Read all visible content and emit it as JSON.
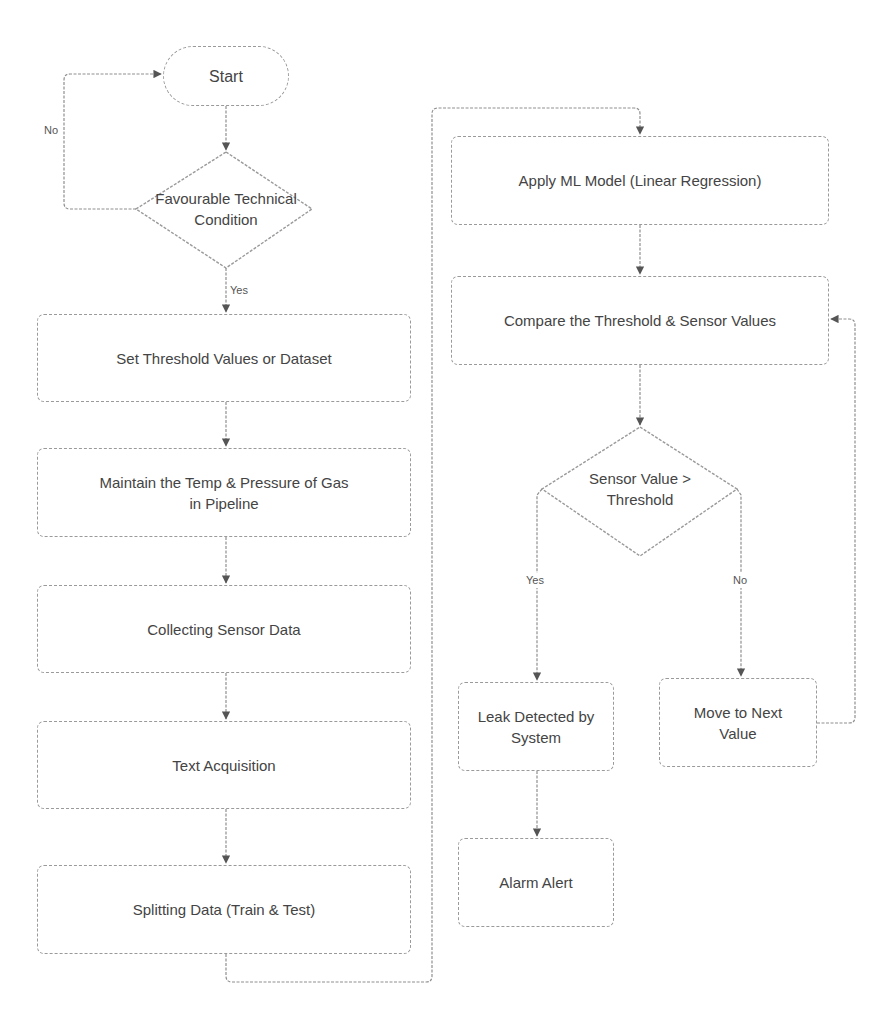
{
  "diagram": {
    "type": "flowchart",
    "nodes": {
      "start": "Start",
      "favourable": "Favourable Technical Condition",
      "set_threshold": "Set Threshold Values or Dataset",
      "maintain": "Maintain the Temp & Pressure of Gas in Pipeline",
      "collecting": "Collecting Sensor Data",
      "text_acquisition": "Text Acquisition",
      "splitting": "Splitting Data (Train & Test)",
      "apply_ml": "Apply ML Model (Linear Regression)",
      "compare": "Compare the Threshold & Sensor Values",
      "sensor_check": "Sensor Value > Threshold",
      "leak": "Leak Detected by System",
      "move_next": "Move to Next Value",
      "alarm": "Alarm Alert"
    },
    "edge_labels": {
      "favourable_no": "No",
      "favourable_yes": "Yes",
      "sensor_yes": "Yes",
      "sensor_no": "No"
    },
    "edges": [
      {
        "from": "start",
        "to": "favourable"
      },
      {
        "from": "favourable",
        "to": "start",
        "label": "No"
      },
      {
        "from": "favourable",
        "to": "set_threshold",
        "label": "Yes"
      },
      {
        "from": "set_threshold",
        "to": "maintain"
      },
      {
        "from": "maintain",
        "to": "collecting"
      },
      {
        "from": "collecting",
        "to": "text_acquisition"
      },
      {
        "from": "text_acquisition",
        "to": "splitting"
      },
      {
        "from": "splitting",
        "to": "apply_ml"
      },
      {
        "from": "apply_ml",
        "to": "compare"
      },
      {
        "from": "compare",
        "to": "sensor_check"
      },
      {
        "from": "sensor_check",
        "to": "leak",
        "label": "Yes"
      },
      {
        "from": "sensor_check",
        "to": "move_next",
        "label": "No"
      },
      {
        "from": "leak",
        "to": "alarm"
      },
      {
        "from": "move_next",
        "to": "compare"
      }
    ],
    "colors": {
      "line": "#8f8f8f",
      "text": "#444444",
      "background": "#ffffff"
    }
  }
}
